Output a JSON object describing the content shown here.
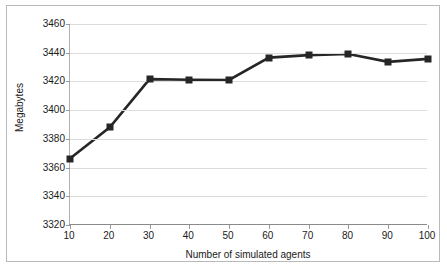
{
  "chart_data": {
    "type": "line",
    "title": "",
    "subtitle": "",
    "xlabel": "Number of simulated agents",
    "ylabel": "Megabytes",
    "x": [
      10,
      20,
      30,
      40,
      50,
      60,
      70,
      80,
      90,
      100
    ],
    "values": [
      3366.3,
      3388.0,
      3421.6,
      3421.2,
      3421.0,
      3436.6,
      3438.3,
      3439.1,
      3433.6,
      3435.7
    ],
    "series": [
      {
        "name": "Memory usage",
        "values": [
          3366.3,
          3388.0,
          3421.6,
          3421.2,
          3421.0,
          3436.6,
          3438.3,
          3439.1,
          3433.6,
          3435.7
        ]
      }
    ],
    "xlim": [
      10,
      100
    ],
    "ylim": [
      3320,
      3460
    ],
    "xticks": [
      10,
      20,
      30,
      40,
      50,
      60,
      70,
      80,
      90,
      100
    ],
    "yticks": [
      3320,
      3340,
      3360,
      3380,
      3400,
      3420,
      3440,
      3460
    ],
    "xtick_labels": [
      "10",
      "20",
      "30",
      "40",
      "50",
      "60",
      "70",
      "80",
      "90",
      "100"
    ],
    "ytick_labels": [
      "3320",
      "3340",
      "3360",
      "3380",
      "3400",
      "3420",
      "3440",
      "3460"
    ],
    "grid": "horizontal",
    "legend": "none",
    "marker": "square",
    "line_color": "#262626",
    "marker_color": "#262626",
    "grid_color": "#dcdcdc",
    "background_color": "#ffffff",
    "border_color": "#b9b9b9"
  }
}
